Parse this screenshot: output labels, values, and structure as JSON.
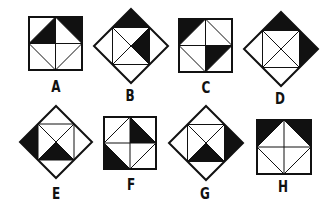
{
  "colors": {
    "stroke": "#111111",
    "fill": "#111111",
    "background": "#ffffff"
  },
  "figures": [
    {
      "id": "A",
      "label": "A",
      "shape": "square",
      "x": 29,
      "y": 17,
      "size": 53,
      "label_x": 56,
      "label_y": 80,
      "shaded": [
        "inner-top-left",
        "outer-top-right"
      ]
    },
    {
      "id": "B",
      "label": "B",
      "shape": "diamond",
      "cx": 131,
      "cy": 46,
      "r": 37,
      "label_x": 130,
      "label_y": 89,
      "shaded": [
        "outer-top",
        "inner-right"
      ]
    },
    {
      "id": "C",
      "label": "C",
      "shape": "square",
      "x": 179,
      "y": 19,
      "size": 53,
      "label_x": 206,
      "label_y": 81,
      "shaded": [
        "outer-top-left",
        "inner-bottom-right"
      ]
    },
    {
      "id": "D",
      "label": "D",
      "shape": "diamond",
      "cx": 281,
      "cy": 49,
      "r": 37,
      "label_x": 280,
      "label_y": 92,
      "shaded": [
        "outer-top",
        "outer-right"
      ]
    },
    {
      "id": "E",
      "label": "E",
      "shape": "diamond",
      "cx": 56,
      "cy": 142,
      "r": 36,
      "label_x": 56,
      "label_y": 187,
      "shaded": [
        "outer-left",
        "inner-bottom"
      ]
    },
    {
      "id": "F",
      "label": "F",
      "shape": "square",
      "x": 104,
      "y": 117,
      "size": 52,
      "label_x": 131,
      "label_y": 178,
      "shaded": [
        "inner-top-right",
        "outer-bottom-left"
      ]
    },
    {
      "id": "G",
      "label": "G",
      "shape": "diamond",
      "cx": 206,
      "cy": 143,
      "r": 37,
      "label_x": 205,
      "label_y": 187,
      "shaded": [
        "outer-right",
        "inner-bottom"
      ]
    },
    {
      "id": "H",
      "label": "H",
      "shape": "square",
      "x": 257,
      "y": 120,
      "size": 54,
      "label_x": 283,
      "label_y": 180,
      "shaded": [
        "outer-top-left",
        "outer-top-right"
      ]
    }
  ]
}
